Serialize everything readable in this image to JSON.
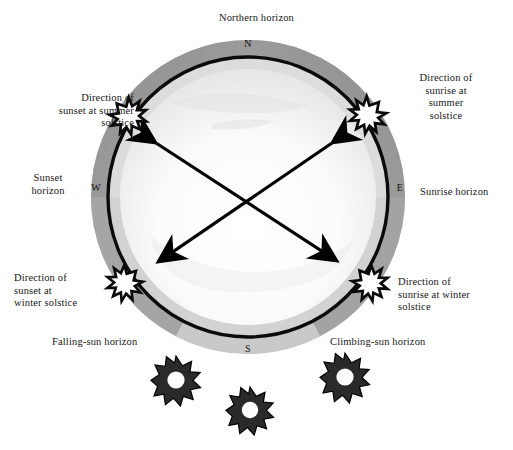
{
  "diagram": {
    "cardinals": {
      "north": "N",
      "south": "S",
      "west": "W",
      "east": "E"
    },
    "labels": {
      "northern_horizon": "Northern horizon",
      "sunset_summer_solstice": "Direction of\nsunset at summer\nsolstice",
      "sunrise_summer_solstice": "Direction of\nsunrise at\nsummer\nsolstice",
      "sunset_horizon": "Sunset\nhorizon",
      "sunrise_horizon": "Sunrise horizon",
      "sunset_winter_solstice": "Direction of\nsunset at\nwinter solstice",
      "sunrise_winter_solstice": "Direction of\nsunrise at winter\nsolstice",
      "falling_sun_horizon": "Falling-sun horizon",
      "climbing_sun_horizon": "Climbing-sun horizon"
    },
    "colors": {
      "outer_ring_dark": "#9a9a9a",
      "outer_ring_light": "#c9c9c9",
      "outer_ring_bottom": "#b8b8b8",
      "inner_band": "#d6d6d6",
      "inner_disc": "#ffffff",
      "inner_disc_shade": "#e8e8e8",
      "circle_stroke": "#000000",
      "arrow_stroke": "#000000",
      "burst_fill": "#ffffff",
      "burst_stroke": "#000000",
      "sun_fill": "#d9d9d9",
      "text": "#171717"
    },
    "geometry": {
      "center_x": 248,
      "center_y": 197,
      "outer_ring_radius": 156,
      "main_circle_radius": 140,
      "inner_disc_radius": 128
    },
    "burst_markers": [
      {
        "name": "sunset-summer-solstice-burst",
        "x": 128,
        "y": 116
      },
      {
        "name": "sunrise-summer-solstice-burst",
        "x": 368,
        "y": 115
      },
      {
        "name": "sunset-winter-solstice-burst",
        "x": 125,
        "y": 283
      },
      {
        "name": "sunrise-winter-solstice-burst",
        "x": 370,
        "y": 283
      }
    ],
    "arrows": [
      {
        "name": "summer-solstice-axis",
        "from_x": 150,
        "from_y": 139,
        "to_x": 343,
        "to_y": 265,
        "double_headed": true
      },
      {
        "name": "winter-solstice-axis",
        "from_x": 338,
        "from_y": 138,
        "to_x": 152,
        "to_y": 266,
        "double_headed": true
      }
    ],
    "suns": [
      {
        "name": "sun-left",
        "x": 176,
        "y": 381,
        "r": 25
      },
      {
        "name": "sun-center",
        "x": 250,
        "y": 411,
        "r": 24
      },
      {
        "name": "sun-right",
        "x": 345,
        "y": 378,
        "r": 25
      }
    ]
  }
}
